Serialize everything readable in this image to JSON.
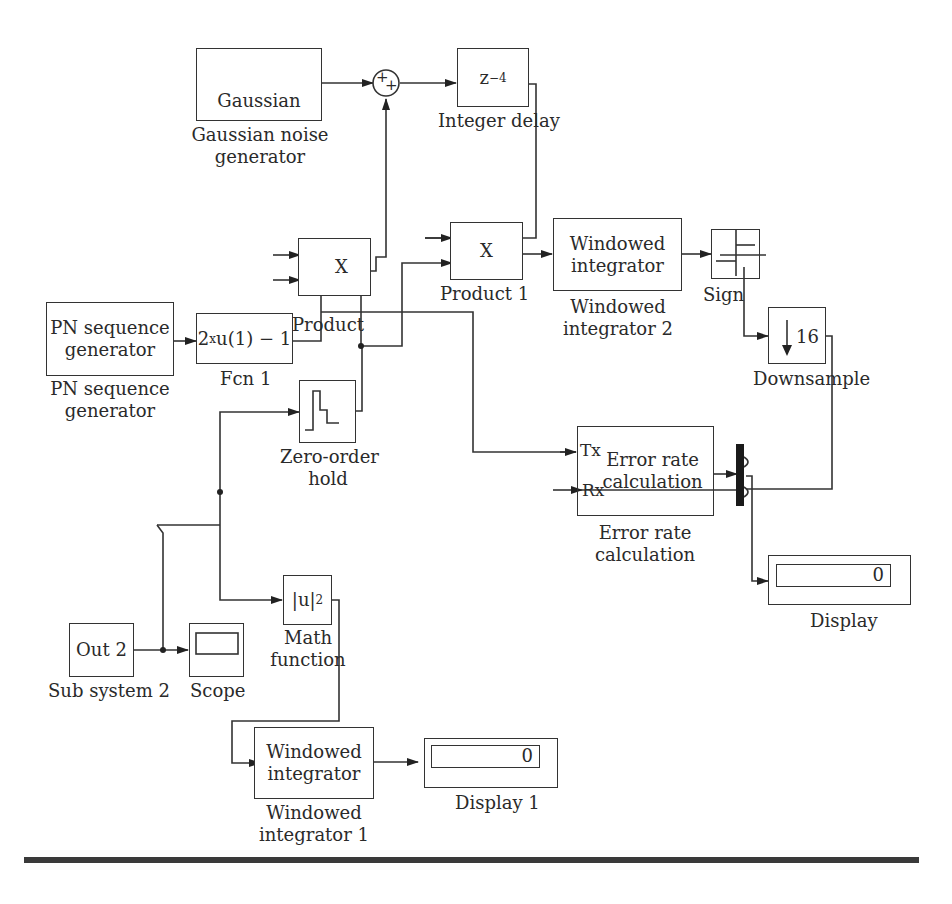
{
  "diagram": {
    "type": "Simulink block diagram",
    "blocks": {
      "gaussian": {
        "text": "Gaussian",
        "label_line1": "Gaussian noise",
        "label_line2": "generator"
      },
      "sum": {
        "sign1": "+",
        "sign2": "+"
      },
      "integer_delay": {
        "base": "z",
        "exp": "−4",
        "label": "Integer delay"
      },
      "product": {
        "text": "X",
        "label": "Product"
      },
      "product1": {
        "text": "X",
        "label": "Product 1"
      },
      "windowed_integrator_2": {
        "line1": "Windowed",
        "line2": "integrator",
        "label_line1": "Windowed",
        "label_line2": "integrator 2"
      },
      "sign": {
        "label": "Sign"
      },
      "downsample": {
        "value": "16",
        "label": "Downsample"
      },
      "pn_sequence": {
        "line1": "PN sequence",
        "line2": "generator",
        "label_line1": "PN sequence",
        "label_line2": "generator"
      },
      "fcn1": {
        "expr_base": "2",
        "expr_sup": "x",
        "expr_rest": "u(1) − 1",
        "label": "Fcn 1"
      },
      "zero_order_hold": {
        "label_line1": "Zero-order",
        "label_line2": "hold"
      },
      "error_rate": {
        "port_tx": "Tx",
        "port_rx": "Rx",
        "line1": "Error rate",
        "line2": "calculation",
        "label_line1": "Error rate",
        "label_line2": "calculation"
      },
      "display": {
        "value": "0",
        "label": "Display"
      },
      "subsystem2": {
        "text": "Out 2",
        "label": "Sub system 2"
      },
      "scope": {
        "label": "Scope"
      },
      "math_function": {
        "text": "|u|",
        "sup": "2",
        "label_line1": "Math",
        "label_line2": "function"
      },
      "windowed_integrator_1": {
        "line1": "Windowed",
        "line2": "integrator",
        "label_line1": "Windowed",
        "label_line2": "integrator 1"
      },
      "display1": {
        "value": "0",
        "label": "Display 1"
      }
    },
    "colors": {
      "line": "#333333",
      "background": "#ffffff",
      "bus": "#1a1a1a"
    }
  }
}
